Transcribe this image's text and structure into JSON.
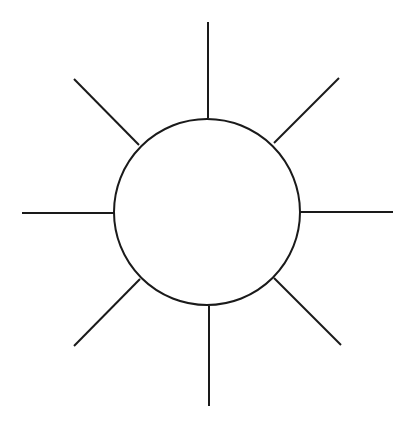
{
  "diagram": {
    "type": "sun-symbol",
    "background": "#ffffff",
    "stroke_color": "#1a1a1a",
    "stroke_width": 2,
    "circle": {
      "cx": 207,
      "cy": 212,
      "r": 93
    },
    "rays": [
      {
        "name": "ray-top",
        "x1": 208,
        "y1": 22,
        "x2": 208,
        "y2": 118
      },
      {
        "name": "ray-top-right",
        "x1": 274,
        "y1": 143,
        "x2": 339,
        "y2": 78
      },
      {
        "name": "ray-right",
        "x1": 300,
        "y1": 212,
        "x2": 393,
        "y2": 212
      },
      {
        "name": "ray-bottom-right",
        "x1": 274,
        "y1": 278,
        "x2": 341,
        "y2": 345
      },
      {
        "name": "ray-bottom",
        "x1": 209,
        "y1": 306,
        "x2": 209,
        "y2": 406
      },
      {
        "name": "ray-bottom-left",
        "x1": 140,
        "y1": 279,
        "x2": 74,
        "y2": 346
      },
      {
        "name": "ray-left",
        "x1": 22,
        "y1": 213,
        "x2": 114,
        "y2": 213
      },
      {
        "name": "ray-top-left",
        "x1": 74,
        "y1": 79,
        "x2": 139,
        "y2": 145
      }
    ]
  }
}
